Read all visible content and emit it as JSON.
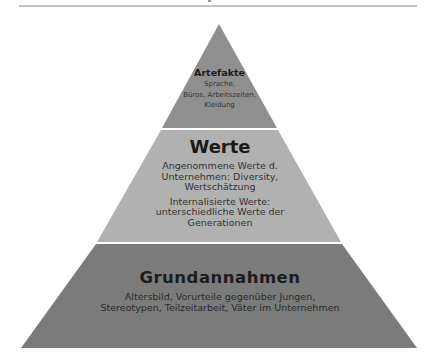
{
  "diagram": {
    "type": "pyramid",
    "colors": {
      "top": "#8f8f8f",
      "middle": "#b1b1b1",
      "bottom": "#7b7b7b",
      "rule": "#c4c4c4"
    },
    "tiers": [
      {
        "title": "Artefakte",
        "lines": [
          "Sprache,",
          "Büros, Arbeitszeiten,",
          "Kleidung"
        ]
      },
      {
        "title": "Werte",
        "lines": [
          "Angenommene Werte d.",
          "Unternehmen: Diversity,",
          "Wertschätzung"
        ],
        "lines2": [
          "Internalisierte Werte:",
          "unterschiedliche Werte der",
          "Generationen"
        ]
      },
      {
        "title": "Grundannahmen",
        "lines": [
          "Altersbild, Vorurteile gegenüber Jungen,",
          "Stereotypen, Teilzeitarbeit, Väter im Unternehmen"
        ]
      }
    ]
  }
}
